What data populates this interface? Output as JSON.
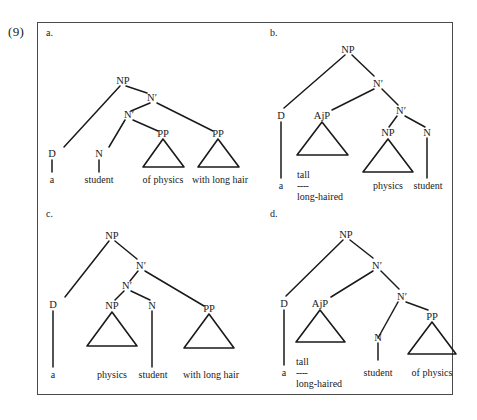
{
  "example": {
    "number": "(9)"
  },
  "panel": {
    "border_color": "#4a4a4a",
    "background": "#ffffff"
  },
  "trees": [
    {
      "id": "a",
      "label": "a.",
      "nodes": [
        {
          "name": "root-np",
          "text": "NP"
        },
        {
          "name": "nbar-upper",
          "text": "N′"
        },
        {
          "name": "nbar-lower",
          "text": "N′"
        },
        {
          "name": "det",
          "text": "D"
        },
        {
          "name": "noun",
          "text": "N"
        },
        {
          "name": "pp-first",
          "text": "PP"
        },
        {
          "name": "pp-second",
          "text": "PP"
        }
      ],
      "leaves": [
        {
          "name": "leaf-a",
          "text": "a"
        },
        {
          "name": "leaf-student",
          "text": "student"
        },
        {
          "name": "leaf-of-physics",
          "text": "of physics"
        },
        {
          "name": "leaf-with-long-hair",
          "text": "with long hair"
        }
      ]
    },
    {
      "id": "b",
      "label": "b.",
      "nodes": [
        {
          "name": "root-np",
          "text": "NP"
        },
        {
          "name": "nbar-upper",
          "text": "N′"
        },
        {
          "name": "det",
          "text": "D"
        },
        {
          "name": "ajp",
          "text": "AjP"
        },
        {
          "name": "nbar-lower",
          "text": "N′"
        },
        {
          "name": "np-inner",
          "text": "NP"
        },
        {
          "name": "noun",
          "text": "N"
        }
      ],
      "leaves": [
        {
          "name": "leaf-a",
          "text": "a"
        },
        {
          "name": "leaf-tall",
          "text": "tall"
        },
        {
          "name": "leaf-dash",
          "text": "----"
        },
        {
          "name": "leaf-long-haired",
          "text": "long-haired"
        },
        {
          "name": "leaf-physics",
          "text": "physics"
        },
        {
          "name": "leaf-student",
          "text": "student"
        }
      ]
    },
    {
      "id": "c",
      "label": "c.",
      "nodes": [
        {
          "name": "root-np",
          "text": "NP"
        },
        {
          "name": "nbar-upper",
          "text": "N′"
        },
        {
          "name": "nbar-lower",
          "text": "N′"
        },
        {
          "name": "det",
          "text": "D"
        },
        {
          "name": "np-inner",
          "text": "NP"
        },
        {
          "name": "noun",
          "text": "N"
        },
        {
          "name": "pp",
          "text": "PP"
        }
      ],
      "leaves": [
        {
          "name": "leaf-a",
          "text": "a"
        },
        {
          "name": "leaf-physics",
          "text": "physics"
        },
        {
          "name": "leaf-student",
          "text": "student"
        },
        {
          "name": "leaf-with-long-hair",
          "text": "with long hair"
        }
      ]
    },
    {
      "id": "d",
      "label": "d.",
      "nodes": [
        {
          "name": "root-np",
          "text": "NP"
        },
        {
          "name": "nbar-upper",
          "text": "N′"
        },
        {
          "name": "nbar-lower",
          "text": "N′"
        },
        {
          "name": "det",
          "text": "D"
        },
        {
          "name": "ajp",
          "text": "AjP"
        },
        {
          "name": "noun",
          "text": "N"
        },
        {
          "name": "pp",
          "text": "PP"
        }
      ],
      "leaves": [
        {
          "name": "leaf-a",
          "text": "a"
        },
        {
          "name": "leaf-tall",
          "text": "tall"
        },
        {
          "name": "leaf-dash",
          "text": "----"
        },
        {
          "name": "leaf-long-haired",
          "text": "long-haired"
        },
        {
          "name": "leaf-student",
          "text": "student"
        },
        {
          "name": "leaf-of-physics",
          "text": "of physics"
        }
      ]
    }
  ]
}
